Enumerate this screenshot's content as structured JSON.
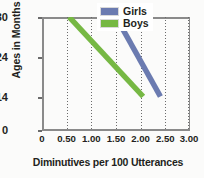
{
  "chart_data": {
    "type": "line",
    "title": "",
    "xlabel": "Diminutives per 100 Utterances",
    "ylabel": "Ages in Months",
    "xlim": [
      0,
      3.0
    ],
    "ylim": [
      0,
      30
    ],
    "x_ticks": [
      "0",
      "0.50",
      "1.00",
      "1.50",
      "2.00",
      "2.50",
      "3.00"
    ],
    "x_tick_values": [
      0,
      0.5,
      1.0,
      1.5,
      2.0,
      2.5,
      3.0
    ],
    "y_ticks": [
      "0",
      "14",
      "24",
      "30"
    ],
    "y_tick_values": [
      0,
      14,
      24,
      30
    ],
    "y_axis_scale": "non-linear category spacing",
    "grid": "vertical dotted gridlines at 0.50, 1.00, 1.50, 2.00, 2.50, 3.00",
    "legend_position": "top-right inside plot",
    "series": [
      {
        "name": "Girls",
        "color": "#6b7bb0",
        "points": [
          {
            "x": 1.5,
            "y": 30
          },
          {
            "x": 2.4,
            "y": 14
          }
        ]
      },
      {
        "name": "Boys",
        "color": "#76b843",
        "points": [
          {
            "x": 0.55,
            "y": 30
          },
          {
            "x": 2.05,
            "y": 14
          }
        ]
      }
    ]
  },
  "legend": {
    "items": [
      {
        "label": "Girls",
        "color": "#6b7bb0"
      },
      {
        "label": "Boys",
        "color": "#76b843"
      }
    ]
  },
  "axes": {
    "y_title": "Ages in Months",
    "x_title": "Diminutives per 100 Utterances",
    "y_labels": [
      "30",
      "24",
      "14",
      "0"
    ],
    "x_labels": [
      "0",
      "0.50",
      "1.00",
      "1.50",
      "2.00",
      "2.50",
      "3.00"
    ]
  }
}
